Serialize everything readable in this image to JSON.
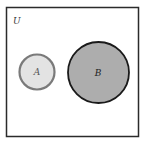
{
  "diagram": {
    "type": "venn",
    "universe": {
      "label": "U",
      "border_color": "#2b2b2b"
    },
    "sets": [
      {
        "label": "A",
        "fill": "#e3e3e3",
        "stroke": "#7a7a7a"
      },
      {
        "label": "B",
        "fill": "#adadad",
        "stroke": "#1a1a1a"
      }
    ],
    "relationship": "disjoint"
  }
}
